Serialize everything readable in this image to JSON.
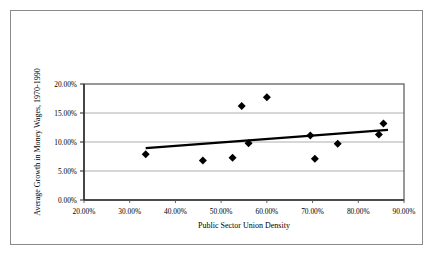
{
  "figure": {
    "frame_color": "#8a8a8a",
    "background": "#ffffff"
  },
  "chart_data": {
    "type": "scatter",
    "title": "",
    "xlabel": "Public Sector Union Density",
    "ylabel": "Average Growth in Money Wages, 1970-1990",
    "xlim": [
      20,
      90
    ],
    "ylim": [
      0,
      20
    ],
    "xticks": [
      20,
      30,
      40,
      50,
      60,
      70,
      80,
      90
    ],
    "yticks": [
      0,
      5,
      10,
      15,
      20
    ],
    "xtick_labels": [
      "20.00%",
      "30.00%",
      "40.00%",
      "50.00%",
      "60.00%",
      "70.00%",
      "80.00%",
      "90.00%"
    ],
    "ytick_labels": [
      "0.00%",
      "5.00%",
      "10.00%",
      "15.00%",
      "20.00%"
    ],
    "grid": "horizontal",
    "grid_color": "#9a9a9a",
    "legend": "none",
    "marker": "diamond",
    "marker_color": "#000000",
    "marker_size": 6,
    "points": [
      {
        "x": 33.5,
        "y": 7.9
      },
      {
        "x": 46.0,
        "y": 6.8
      },
      {
        "x": 52.5,
        "y": 7.3
      },
      {
        "x": 54.5,
        "y": 16.2
      },
      {
        "x": 56.0,
        "y": 9.8
      },
      {
        "x": 60.0,
        "y": 17.7
      },
      {
        "x": 69.5,
        "y": 11.1
      },
      {
        "x": 70.5,
        "y": 7.1
      },
      {
        "x": 75.5,
        "y": 9.7
      },
      {
        "x": 84.5,
        "y": 11.3
      },
      {
        "x": 85.5,
        "y": 13.2
      }
    ],
    "trendline": {
      "type": "linear",
      "color": "#000000",
      "width": 2.2,
      "x_start": 33.5,
      "y_start": 8.95,
      "x_end": 86.5,
      "y_end": 12.1
    }
  }
}
